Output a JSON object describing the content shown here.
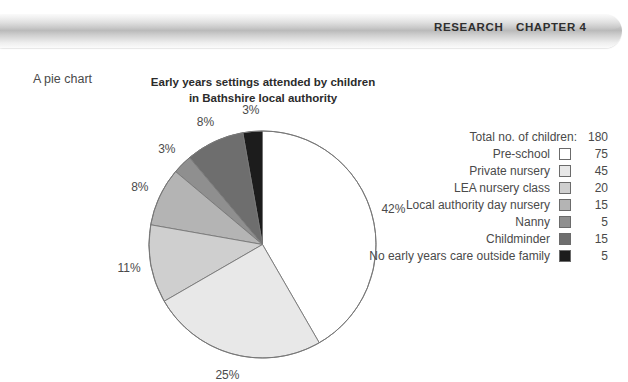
{
  "header": {
    "research_label": "RESEARCH",
    "chapter_label": "CHAPTER 4"
  },
  "figure": {
    "caption": "A pie chart"
  },
  "chart_data": {
    "type": "pie",
    "title": "Early years settings attended by children in Bathshire local authority",
    "title_line1": "Early years settings attended by children",
    "title_line2": "in Bathshire local authority",
    "total_label": "Total no. of children:",
    "total_value": "180",
    "categories": [
      "Pre-school",
      "Private nursery",
      "LEA nursery class",
      "Local authority day nursery",
      "Nanny",
      "Childminder",
      "No early years care outside family"
    ],
    "values": [
      75,
      45,
      20,
      15,
      5,
      15,
      5
    ],
    "percent_labels": [
      "42%",
      "25%",
      "11%",
      "8%",
      "3%",
      "8%",
      "3%"
    ],
    "percents": [
      42,
      25,
      11,
      8,
      3,
      8,
      3
    ],
    "colors": [
      "#ffffff",
      "#e8e8e8",
      "#cfcfcf",
      "#b4b4b4",
      "#8f8f8f",
      "#6e6e6e",
      "#1c1c1c"
    ],
    "slice_outline_color": "#777777",
    "legend_position": "right",
    "start_angle_deg": 0,
    "direction": "clockwise"
  }
}
